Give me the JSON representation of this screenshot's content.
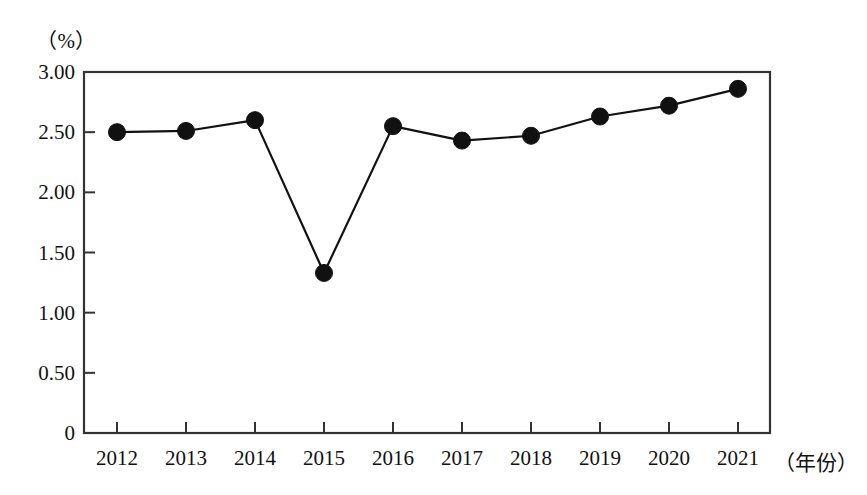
{
  "chart_data": {
    "type": "line",
    "title": "",
    "subtitle": "",
    "unit_label": "（%）",
    "xlabel": "（年份）",
    "ylabel": "",
    "categories": [
      "2012",
      "2013",
      "2014",
      "2015",
      "2016",
      "2017",
      "2018",
      "2019",
      "2020",
      "2021"
    ],
    "values": [
      2.5,
      2.51,
      2.6,
      1.33,
      2.55,
      2.43,
      2.47,
      2.63,
      2.72,
      2.86
    ],
    "series": [
      {
        "name": "",
        "values": [
          2.5,
          2.51,
          2.6,
          1.33,
          2.55,
          2.43,
          2.47,
          2.63,
          2.72,
          2.86
        ]
      }
    ],
    "ylim": [
      0,
      3.0
    ],
    "xlim": [
      "2012",
      "2021"
    ],
    "y_tick_labels": [
      "3.00",
      "2.50",
      "2.00",
      "1.50",
      "1.00",
      "0.50",
      "0"
    ],
    "y_tick_values": [
      3.0,
      2.5,
      2.0,
      1.5,
      1.0,
      0.5,
      0
    ],
    "x_tick_labels": [
      "2012",
      "2013",
      "2014",
      "2015",
      "2016",
      "2017",
      "2018",
      "2019",
      "2020",
      "2021"
    ],
    "grid": false,
    "legend": "none",
    "marker": "filled-circle",
    "line_color": "#111111",
    "marker_color": "#111111",
    "axis_color": "#333333",
    "background_color": "#ffffff"
  }
}
